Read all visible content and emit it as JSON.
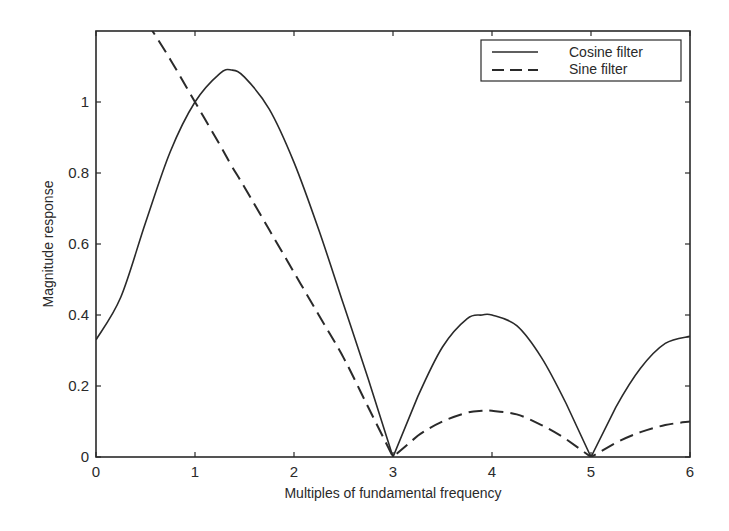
{
  "chart_data": {
    "type": "line",
    "title": "",
    "xlabel": "Multiples of fundamental frequency",
    "ylabel": "Magnitude response",
    "xlim": [
      0,
      6
    ],
    "ylim": [
      0,
      1.2
    ],
    "xticks": [
      "0",
      "1",
      "2",
      "3",
      "4",
      "5",
      "6"
    ],
    "yticks": [
      "0",
      "0.2",
      "0.4",
      "0.6",
      "0.8",
      "1"
    ],
    "ytick_values": [
      0,
      0.2,
      0.4,
      0.6,
      0.8,
      1.0
    ],
    "grid": false,
    "legend_position": "upper right",
    "x": [
      0,
      0.25,
      0.5,
      0.75,
      1.0,
      1.25,
      1.37,
      1.5,
      1.75,
      2.0,
      2.25,
      2.5,
      2.75,
      3.0,
      3.25,
      3.5,
      3.75,
      3.9,
      4.0,
      4.25,
      4.5,
      4.75,
      5.0,
      5.25,
      5.5,
      5.75,
      6.0
    ],
    "series": [
      {
        "name": "Cosine filter",
        "style": "solid",
        "values": [
          0.33,
          0.45,
          0.66,
          0.86,
          1.0,
          1.08,
          1.09,
          1.07,
          0.98,
          0.83,
          0.64,
          0.43,
          0.22,
          0.0,
          0.17,
          0.31,
          0.39,
          0.4,
          0.4,
          0.37,
          0.28,
          0.15,
          0.0,
          0.14,
          0.25,
          0.32,
          0.34
        ]
      },
      {
        "name": "Sine filter",
        "style": "dashed",
        "values": [
          1.41,
          1.33,
          1.23,
          1.12,
          1.0,
          0.88,
          0.82,
          0.76,
          0.64,
          0.52,
          0.4,
          0.28,
          0.14,
          0.0,
          0.06,
          0.1,
          0.125,
          0.13,
          0.13,
          0.12,
          0.09,
          0.05,
          0.0,
          0.04,
          0.07,
          0.09,
          0.1
        ]
      }
    ]
  },
  "legend": {
    "items": [
      {
        "label": "Cosine filter"
      },
      {
        "label": "Sine filter"
      }
    ]
  },
  "colors": {
    "line": "#2a2a2a",
    "frame": "#2a2a2a",
    "background": "#ffffff"
  }
}
